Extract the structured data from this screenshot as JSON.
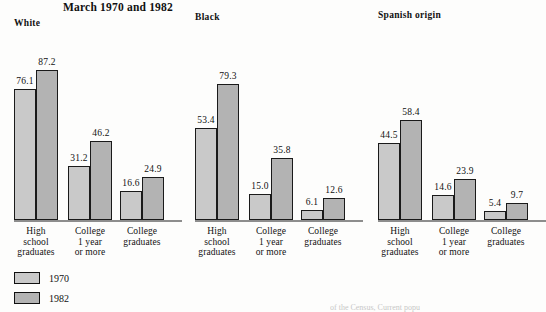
{
  "chart_data": {
    "type": "bar",
    "title": "March 1970 and 1982",
    "xlabel": "",
    "ylabel": "",
    "ylim": [
      0,
      100
    ],
    "grid": false,
    "legend_position": "bottom-left",
    "categories": [
      "High\nschool\ngraduates",
      "College\n1 year\nor more",
      "College\ngraduates"
    ],
    "series": [
      {
        "name": "1970",
        "color": "#c9c9c9"
      },
      {
        "name": "1982",
        "color": "#b3b3b3"
      }
    ],
    "panels": [
      {
        "name": "White",
        "values_1970": [
          76.1,
          31.2,
          16.6
        ],
        "values_1982": [
          87.2,
          46.2,
          24.9
        ],
        "labels_1970": [
          "76.1",
          "31.2",
          "16.6"
        ],
        "labels_1982": [
          "87.2",
          "46.2",
          "24.9"
        ]
      },
      {
        "name": "Black",
        "values_1970": [
          53.4,
          15.0,
          6.1
        ],
        "values_1982": [
          79.3,
          35.8,
          12.6
        ],
        "labels_1970": [
          "53.4",
          "15.0",
          "6.1"
        ],
        "labels_1982": [
          "79.3",
          "35.8",
          "12.6"
        ]
      },
      {
        "name": "Spanish origin",
        "values_1970": [
          44.5,
          14.6,
          5.4
        ],
        "values_1982": [
          58.4,
          23.9,
          9.7
        ],
        "labels_1970": [
          "44.5",
          "14.6",
          "5.4"
        ],
        "labels_1982": [
          "58.4",
          "23.9",
          "9.7"
        ]
      }
    ]
  },
  "legend": {
    "items": [
      {
        "label": "1970"
      },
      {
        "label": "1982"
      }
    ]
  },
  "footer": {
    "source": "of the Census, Current popu"
  }
}
